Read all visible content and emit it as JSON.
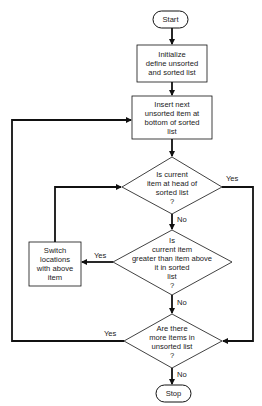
{
  "diagram": {
    "type": "flowchart",
    "nodes": [
      {
        "id": "start",
        "shape": "terminal",
        "text": "Start"
      },
      {
        "id": "init",
        "shape": "process",
        "text": "Initialize\ndefine unsorted\nand sorted list"
      },
      {
        "id": "insert",
        "shape": "process",
        "text": "Insert next\nunsorted item at\nbottom of sorted\nlist"
      },
      {
        "id": "q_head",
        "shape": "decision",
        "text": "Is current\nitem at head of\nsorted list\n?"
      },
      {
        "id": "q_greater",
        "shape": "decision",
        "text": "Is\ncurrent item\ngreater than item above\nit in sorted\nlist\n?"
      },
      {
        "id": "switch",
        "shape": "process",
        "text": "Switch\nlocations\nwith above\nitem"
      },
      {
        "id": "q_more",
        "shape": "decision",
        "text": "Are there\nmore items in\nunsorted list\n?"
      },
      {
        "id": "stop",
        "shape": "terminal",
        "text": "Stop"
      }
    ],
    "edges": [
      {
        "from": "start",
        "to": "init",
        "label": ""
      },
      {
        "from": "init",
        "to": "insert",
        "label": ""
      },
      {
        "from": "insert",
        "to": "q_head",
        "label": ""
      },
      {
        "from": "q_head",
        "to": "q_more",
        "label": "Yes"
      },
      {
        "from": "q_head",
        "to": "q_greater",
        "label": "No"
      },
      {
        "from": "q_greater",
        "to": "switch",
        "label": "Yes"
      },
      {
        "from": "switch",
        "to": "q_head",
        "label": ""
      },
      {
        "from": "q_greater",
        "to": "q_more",
        "label": "No"
      },
      {
        "from": "q_more",
        "to": "insert",
        "label": "Yes"
      },
      {
        "from": "q_more",
        "to": "stop",
        "label": "No"
      }
    ]
  },
  "labels": {
    "start": "Start",
    "init": "Initialize\ndefine unsorted\nand sorted list",
    "insert": "Insert next\nunsorted item at\nbottom of sorted\nlist",
    "q_head": "Is current\nitem at head of\nsorted list\n?",
    "q_greater": "Is\ncurrent item\ngreater than item above\nit in sorted\nlist\n?",
    "switch": "Switch\nlocations\nwith above\nitem",
    "q_more": "Are there\nmore items in\nunsorted list\n?",
    "stop": "Stop",
    "yes": "Yes",
    "no": "No"
  }
}
